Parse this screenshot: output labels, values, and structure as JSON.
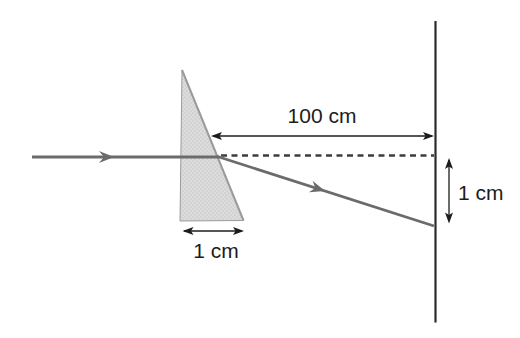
{
  "figure": {
    "labels": {
      "distance_to_screen": "100 cm",
      "prism_base_width": "1 cm",
      "ray_displacement": "1 cm"
    },
    "colors": {
      "background": "#ffffff",
      "ray": "#6b6b6b",
      "dashed": "#3c3c3c",
      "screen": "#2b2b2b",
      "measure": "#1c1c1c",
      "text": "#1c1c1c",
      "prism_fill": "#dcdcdc",
      "prism_stroke": "#9b9b9b",
      "stipple_dot": "#b0b0b0"
    }
  }
}
